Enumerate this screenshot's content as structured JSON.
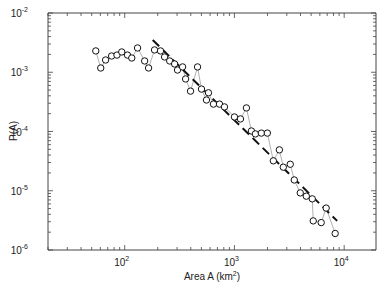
{
  "chart_data": {
    "type": "scatter",
    "title": "",
    "xlabel": "Area A (km²)",
    "ylabel": "P(A)",
    "xscale": "log",
    "yscale": "log",
    "xlim": [
      20,
      19500
    ],
    "ylim": [
      1e-06,
      0.01
    ],
    "grid": false,
    "legend": null,
    "x_tick_labels": [
      "10^2",
      "10^3",
      "10^4"
    ],
    "y_tick_labels": [
      "10^-2",
      "10^-3",
      "10^-4",
      "10^-5",
      "10^-6"
    ],
    "series": [
      {
        "name": "observed",
        "marker": "open-circle",
        "connected": true,
        "line_color": "#b0b0b0",
        "x": [
          54.5,
          60.5,
          67,
          76,
          85,
          94,
          106,
          116,
          131,
          152,
          165,
          187,
          212,
          231,
          257,
          285,
          303,
          337,
          359,
          398,
          461,
          501,
          556,
          580,
          644,
          731,
          811,
          1000,
          1135,
          1286,
          1428,
          1552,
          1760,
          1995,
          2263,
          2567,
          2788,
          3226,
          3510,
          3981,
          4518,
          5119,
          5227,
          6177,
          6855,
          8279
        ],
        "y": [
          0.00229,
          0.00118,
          0.00161,
          0.00188,
          0.00195,
          0.0022,
          0.00195,
          0.00174,
          0.00257,
          0.00155,
          0.00118,
          0.00238,
          0.00229,
          0.00181,
          0.00155,
          0.00138,
          0.00109,
          0.00123,
          0.00077,
          0.00048,
          0.00123,
          0.00052,
          0.00034,
          0.00045,
          0.00029,
          0.00029,
          0.00026,
          0.000176,
          0.000163,
          0.00025,
          0.000102,
          9.1e-05,
          9.4e-05,
          9.4e-05,
          3.2e-05,
          4.9e-05,
          2.5e-05,
          2.8e-05,
          1.52e-05,
          9.2e-06,
          8.1e-06,
          7.3e-06,
          3.1e-06,
          2.9e-06,
          5.1e-06,
          1.9e-06
        ]
      },
      {
        "name": "power-law fit",
        "style": "dashed",
        "line_color": "#111111",
        "x": [
          180,
          8630
        ],
        "y": [
          0.0035,
          3.1e-06
        ]
      }
    ]
  },
  "axes": {
    "xlabel_main": "Area A (km",
    "xlabel_sup": "2",
    "xlabel_close": ")",
    "ylabel": "P(A)",
    "x_ticks": [
      {
        "base": "10",
        "exp": "2",
        "value": 100
      },
      {
        "base": "10",
        "exp": "3",
        "value": 1000
      },
      {
        "base": "10",
        "exp": "4",
        "value": 10000
      }
    ],
    "y_ticks": [
      {
        "base": "10",
        "exp": "-2",
        "value": 0.01
      },
      {
        "base": "10",
        "exp": "-3",
        "value": 0.001
      },
      {
        "base": "10",
        "exp": "-4",
        "value": 0.0001
      },
      {
        "base": "10",
        "exp": "-5",
        "value": 1e-05
      },
      {
        "base": "10",
        "exp": "-6",
        "value": 1e-06
      }
    ]
  },
  "colors": {
    "axis": "#444444",
    "marker": "#111111",
    "connector": "#b0b0b0",
    "fit": "#111111"
  }
}
